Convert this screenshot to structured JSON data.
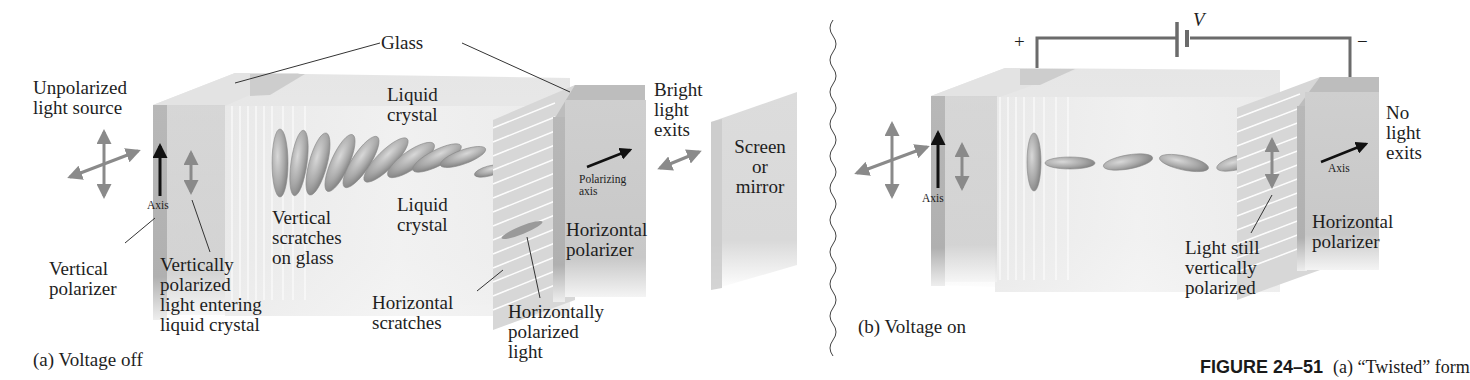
{
  "panel_a": {
    "caption": "(a) Voltage off",
    "labels": {
      "unpolarized": "Unpolarized\nlight source",
      "glass": "Glass",
      "liquid_crystal_top": "Liquid\ncrystal",
      "liquid_crystal_mid": "Liquid\ncrystal",
      "bright_light": "Bright\nlight\nexits",
      "screen": "Screen\nor\nmirror",
      "axis": "Axis",
      "polarizing_axis": "Polarizing\naxis",
      "vertical_polarizer": "Vertical\npolarizer",
      "vertically_polarized": "Vertically\npolarized\nlight entering\nliquid crystal",
      "vertical_scratches": "Vertical\nscratches\non glass",
      "horizontal_scratches": "Horizontal\nscratches",
      "horizontally_polarized": "Horizontally\npolarized\nlight",
      "horizontal_polarizer": "Horizontal\npolarizer"
    }
  },
  "panel_b": {
    "caption": "(b) Voltage on",
    "labels": {
      "plus": "+",
      "minus": "−",
      "voltage": "V",
      "axis_left": "Axis",
      "axis_right": "Axis",
      "no_light": "No\nlight\nexits",
      "light_still": "Light still\nvertically\npolarized",
      "horizontal_polarizer": "Horizontal\npolarizer"
    }
  },
  "figure_caption": {
    "number": "FIGURE 24–51",
    "text": "(a) “Twisted” form"
  },
  "colors": {
    "glass_light": "#ececec",
    "glass_mid": "#d6d6d6",
    "polarizer_face": "#c9c9c9",
    "polarizer_edge": "#b3b3b3",
    "arrow_gray": "#8a8a8a",
    "arrow_black": "#111111",
    "wire": "#6b6b6b",
    "crystal": "#9a9a9a"
  }
}
